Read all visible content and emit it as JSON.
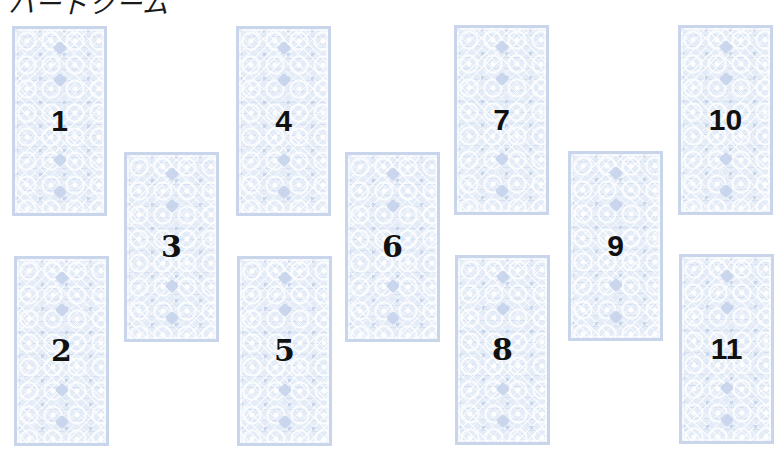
{
  "title": "ハードクーム",
  "colors": {
    "card_border": "#c8d5ea",
    "card_fill": "#e4ecf7",
    "number": "#111111",
    "background": "#ffffff"
  },
  "cards": [
    {
      "position": 1,
      "label": "1",
      "x": 12,
      "y": 26
    },
    {
      "position": 2,
      "label": "2",
      "x": 14,
      "y": 256
    },
    {
      "position": 3,
      "label": "3",
      "x": 124,
      "y": 152
    },
    {
      "position": 4,
      "label": "4",
      "x": 236,
      "y": 26
    },
    {
      "position": 5,
      "label": "5",
      "x": 237,
      "y": 256
    },
    {
      "position": 6,
      "label": "6",
      "x": 345,
      "y": 152
    },
    {
      "position": 7,
      "label": "7",
      "x": 454,
      "y": 25
    },
    {
      "position": 8,
      "label": "8",
      "x": 455,
      "y": 255
    },
    {
      "position": 9,
      "label": "9",
      "x": 568,
      "y": 151
    },
    {
      "position": 10,
      "label": "10",
      "x": 678,
      "y": 25
    },
    {
      "position": 11,
      "label": "11",
      "x": 679,
      "y": 254
    }
  ]
}
